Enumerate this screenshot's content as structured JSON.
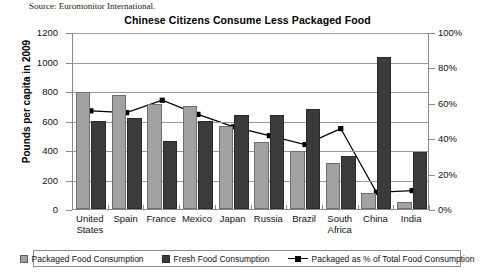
{
  "source_note": "Source: Euromonitor International.",
  "chart_data": {
    "type": "bar",
    "title": "Chinese Citizens Consume Less Packaged Food",
    "xlabel": "",
    "ylabel": "Pounds per capita in 2009",
    "y2label": "",
    "ylim": [
      0,
      1200
    ],
    "y2lim": [
      0,
      100
    ],
    "yticks": [
      "0",
      "200",
      "400",
      "600",
      "800",
      "1000",
      "1200"
    ],
    "y2ticks": [
      "0%",
      "20%",
      "40%",
      "60%",
      "80%",
      "100%"
    ],
    "grid": true,
    "legend_position": "bottom",
    "categories": [
      "United States",
      "Spain",
      "France",
      "Mexico",
      "Japan",
      "Russia",
      "Brazil",
      "South Africa",
      "China",
      "India"
    ],
    "series": [
      {
        "name": "Packaged Food Consumption",
        "type": "bar",
        "axis": "left",
        "color": "#a2a2a2",
        "values": [
          795,
          775,
          710,
          700,
          565,
          455,
          395,
          310,
          110,
          50
        ]
      },
      {
        "name": "Fresh Food Consumption",
        "type": "bar",
        "axis": "left",
        "color": "#3b3b3b",
        "values": [
          600,
          620,
          460,
          595,
          640,
          635,
          680,
          360,
          1030,
          385
        ]
      },
      {
        "name": "Packaged as % of Total Food Consumption",
        "type": "line",
        "axis": "right",
        "color": "#000000",
        "marker": "square",
        "values": [
          56,
          55,
          62,
          54,
          47,
          42,
          37,
          46,
          10,
          11
        ]
      }
    ]
  },
  "legend": {
    "items": [
      {
        "label": "Packaged Food Consumption",
        "marker": "pkg"
      },
      {
        "label": "Fresh Food Consumption",
        "marker": "fresh"
      },
      {
        "label": "Packaged as % of Total Food Consumption",
        "marker": "line"
      }
    ]
  }
}
